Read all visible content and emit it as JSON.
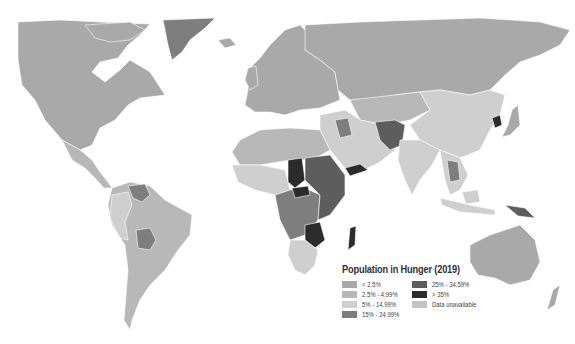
{
  "map": {
    "title": "Population in Hunger (2019)",
    "colors": {
      "below_2_5": "#a9a9a9",
      "2_5_to_4_99": "#b8b8b8",
      "5_to_14_99": "#cfcfcf",
      "15_to_24_99": "#7e7e7e",
      "25_to_34_99": "#5d5d5d",
      "above_35": "#2b2b2b",
      "unavailable": "#c4c4c4",
      "ocean": "#ffffff"
    },
    "regions": [
      {
        "name": "north-america",
        "category": "below_2_5"
      },
      {
        "name": "greenland",
        "category": "15_to_24_99"
      },
      {
        "name": "central-america",
        "category": "2_5_to_4_99"
      },
      {
        "name": "south-america",
        "category": "2_5_to_4_99"
      },
      {
        "name": "venezuela",
        "category": "15_to_24_99"
      },
      {
        "name": "bolivia",
        "category": "15_to_24_99"
      },
      {
        "name": "peru-colombia",
        "category": "5_to_14_99"
      },
      {
        "name": "europe",
        "category": "below_2_5"
      },
      {
        "name": "russia",
        "category": "below_2_5"
      },
      {
        "name": "north-africa",
        "category": "2_5_to_4_99"
      },
      {
        "name": "west-africa",
        "category": "5_to_14_99"
      },
      {
        "name": "central-africa",
        "category": "15_to_24_99"
      },
      {
        "name": "chad",
        "category": "above_35"
      },
      {
        "name": "car",
        "category": "above_35"
      },
      {
        "name": "east-africa",
        "category": "25_to_34_99"
      },
      {
        "name": "zambia-zimbabwe",
        "category": "above_35"
      },
      {
        "name": "southern-africa",
        "category": "5_to_14_99"
      },
      {
        "name": "madagascar",
        "category": "above_35"
      },
      {
        "name": "middle-east",
        "category": "5_to_14_99"
      },
      {
        "name": "yemen",
        "category": "above_35"
      },
      {
        "name": "iraq",
        "category": "15_to_24_99"
      },
      {
        "name": "afghanistan-pakistan",
        "category": "25_to_34_99"
      },
      {
        "name": "central-asia",
        "category": "2_5_to_4_99"
      },
      {
        "name": "china",
        "category": "5_to_14_99"
      },
      {
        "name": "india",
        "category": "5_to_14_99"
      },
      {
        "name": "north-korea",
        "category": "above_35"
      },
      {
        "name": "japan",
        "category": "below_2_5"
      },
      {
        "name": "southeast-asia",
        "category": "5_to_14_99"
      },
      {
        "name": "indochina",
        "category": "15_to_24_99"
      },
      {
        "name": "indonesia",
        "category": "5_to_14_99"
      },
      {
        "name": "papua-new-guinea",
        "category": "25_to_34_99"
      },
      {
        "name": "australia",
        "category": "below_2_5"
      },
      {
        "name": "new-zealand",
        "category": "below_2_5"
      }
    ]
  },
  "legend": {
    "title": "Population in Hunger (2019)",
    "items": [
      {
        "label": "< 2.5%",
        "category": "below_2_5"
      },
      {
        "label": "2.5% - 4.99%",
        "category": "2_5_to_4_99"
      },
      {
        "label": "5% - 14.99%",
        "category": "5_to_14_99"
      },
      {
        "label": "15% - 24.99%",
        "category": "15_to_24_99"
      },
      {
        "label": "25% - 34.59%",
        "category": "25_to_34_99"
      },
      {
        "label": "> 35%",
        "category": "above_35"
      },
      {
        "label": "Data unavailable",
        "category": "unavailable"
      }
    ]
  }
}
